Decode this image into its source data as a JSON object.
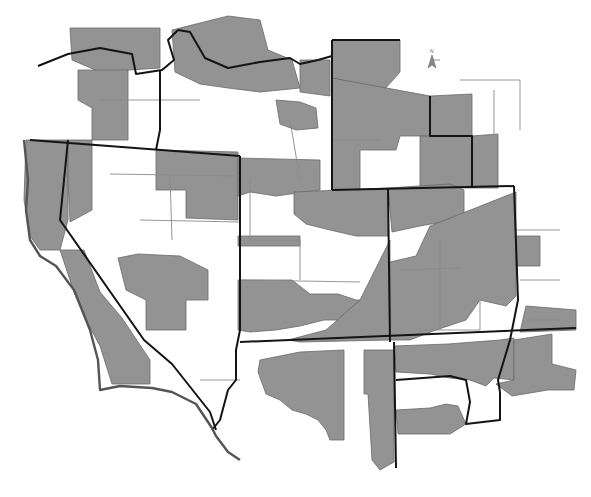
{
  "map": {
    "title": "",
    "top_text_faint": "",
    "colors": {
      "background": "#ffffff",
      "shaded_fill": "#939393",
      "unshaded_fill": "#ffffff",
      "state_border": "#141414",
      "county_border": "#6a6a6a",
      "region_outline": "#555555"
    },
    "north_arrow": {
      "label": "N",
      "x": 432,
      "y": 62
    },
    "legend": null,
    "shaded_regions": [
      {
        "name": "oregon-northwest-band",
        "points": "70,28 160,28 160,68 130,70 100,72 72,60"
      },
      {
        "name": "oregon-central",
        "points": "78,70 128,70 128,140 92,140 92,108 78,100"
      },
      {
        "name": "idaho-north",
        "points": "172,30 228,16 260,20 268,50 292,60 300,88 260,92 228,88 200,84 175,72"
      },
      {
        "name": "idaho-panhandle-east",
        "points": "300,60 330,60 330,96 300,92"
      },
      {
        "name": "idaho-central-east",
        "points": "276,100 300,102 316,108 318,128 296,130 280,124"
      },
      {
        "name": "montana-west",
        "points": "332,40 400,40 400,72 384,90 360,84 332,78"
      },
      {
        "name": "montana-central",
        "points": "332,78 430,96 430,136 400,136 396,150 360,150 360,190 332,190"
      },
      {
        "name": "montana-east",
        "points": "430,96 472,94 472,136 430,136"
      },
      {
        "name": "wyoming-east",
        "points": "420,136 472,136 472,188 420,188"
      },
      {
        "name": "dakota-east",
        "points": "472,136 498,134 498,188 472,188"
      },
      {
        "name": "california-north-coast",
        "points": "26,140 68,140 68,220 60,250 40,250 30,236 24,200"
      },
      {
        "name": "california-north-inland",
        "points": "68,140 92,140 92,210 70,222 68,180"
      },
      {
        "name": "nevada-north-east-block",
        "points": "156,150 238,152 238,220 186,218 186,190 156,190"
      },
      {
        "name": "nevada-center",
        "points": "118,258 138,254 180,256 208,270 208,300 186,300 186,330 146,330 146,300 126,290"
      },
      {
        "name": "california-coast-south",
        "points": "60,250 84,250 100,292 122,318 150,360 150,384 112,384 100,346 86,320 74,292"
      },
      {
        "name": "utah-north",
        "points": "238,158 320,160 320,190 276,196 250,192 238,196"
      },
      {
        "name": "utah-northeast",
        "points": "294,192 388,188 388,236 356,236 330,230 306,224 294,214"
      },
      {
        "name": "utah-mid-left",
        "points": "238,236 300,236 300,246 268,246 238,246"
      },
      {
        "name": "utah-south-wide",
        "points": "238,280 292,280 310,294 338,294 356,300 382,300 384,310 360,320 324,320 300,326 276,330 250,332 238,330"
      },
      {
        "name": "utah-east-band",
        "points": "360,300 390,240 390,340 300,342 288,340 326,330"
      },
      {
        "name": "colorado-west",
        "points": "388,188 450,184 464,190 464,218 420,226 392,232"
      },
      {
        "name": "colorado-main",
        "points": "430,226 516,192 516,296 506,306 480,300 466,320 436,330 410,340 390,340 390,262 416,256"
      },
      {
        "name": "kansas-strip",
        "points": "516,236 540,236 540,266 516,266"
      },
      {
        "name": "kansas-east",
        "points": "526,306 576,310 576,330 520,332"
      },
      {
        "name": "arizona-west",
        "points": "260,360 300,352 344,350 344,440 330,440 326,430 318,420 306,414 292,410 280,400 266,394 258,372"
      },
      {
        "name": "arizona-east",
        "points": "364,350 394,350 394,462 380,470 372,460 368,394 364,394"
      },
      {
        "name": "nm-north",
        "points": "394,346 448,344 500,340 514,338 514,380 494,378 486,386 470,380 450,378 430,374 396,372"
      },
      {
        "name": "nm-south",
        "points": "396,410 430,408 446,404 458,406 466,424 450,434 398,434"
      },
      {
        "name": "tx-panhandle",
        "points": "514,340 552,334 552,364 576,370 574,390 548,390 512,396 496,384 514,380"
      }
    ],
    "state_borders": [
      {
        "name": "oregon-idaho-north",
        "points": "38,66 68,54 100,48 132,54 136,74 162,70 174,60 168,40 178,30"
      },
      {
        "name": "oregon-south-border",
        "points": "30,140 240,156"
      },
      {
        "name": "idaho-west-border",
        "points": "160,70 160,130 156,150"
      },
      {
        "name": "idaho-north-border",
        "points": "178,30 190,32 205,58 228,68 260,62 290,58 300,64 318,60 332,56"
      },
      {
        "name": "montana-west-border",
        "points": "332,40 332,190"
      },
      {
        "name": "montana-north-border",
        "points": "332,40 400,40"
      },
      {
        "name": "wyoming-south-border",
        "points": "332,190 514,186"
      },
      {
        "name": "wyoming-east",
        "points": "430,96 430,136 472,136 472,188"
      },
      {
        "name": "nevada-ca-border",
        "points": "68,140 60,220 144,340 172,364 210,412 216,430"
      },
      {
        "name": "nevada-east-border",
        "points": "240,156 240,330 236,350 236,380 228,390 220,420 212,430"
      },
      {
        "name": "utah-south-border",
        "points": "240,342 576,328"
      },
      {
        "name": "colorado-west-border",
        "points": "388,188 390,342"
      },
      {
        "name": "colorado-east-border",
        "points": "514,186 518,300 510,340 498,380 500,392"
      },
      {
        "name": "az-nm-border",
        "points": "394,342 396,468"
      },
      {
        "name": "nm-texas-border",
        "points": "396,380 450,376 466,380 470,402 466,424 500,420 500,392"
      },
      {
        "name": "west-outline",
        "points": "24,140 28,180 26,210 30,240 40,256 56,266 74,290 90,330 98,360 100,390 120,386 152,388 172,392 196,404 212,428 216,436 228,452 240,460"
      }
    ],
    "thin_lines": [
      {
        "points": "100,100 200,100"
      },
      {
        "points": "110,174 240,176"
      },
      {
        "points": "170,176 172,240"
      },
      {
        "points": "140,220 240,222"
      },
      {
        "points": "250,180 250,240 300,240 300,280"
      },
      {
        "points": "240,280 360,282"
      },
      {
        "points": "332,100 332,140 380,140"
      },
      {
        "points": "516,230 560,230"
      },
      {
        "points": "520,280 560,280"
      },
      {
        "points": "200,380 240,380"
      },
      {
        "points": "290,120 300,180"
      },
      {
        "points": "420,330 480,330 480,300"
      },
      {
        "points": "400,270 460,268"
      },
      {
        "points": "440,238 440,330"
      },
      {
        "points": "530,320 560,320"
      },
      {
        "points": "430,60 440,60"
      },
      {
        "points": "460,80 520,80 520,130"
      },
      {
        "points": "494,90 494,134"
      }
    ]
  }
}
